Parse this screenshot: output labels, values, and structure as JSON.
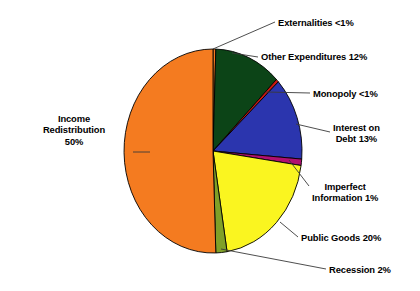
{
  "chart_data": {
    "type": "pie",
    "title": "",
    "subtitle": "",
    "xlabel": "",
    "ylabel": "",
    "legend_position": "none",
    "grid": false,
    "start_angle_deg": 0,
    "direction": "clockwise",
    "background_color": "#FFFFFF",
    "outline_color": "#000000",
    "categories": [
      "Externalities",
      "Other Expenditures",
      "Monopoly",
      "Interest on Debt",
      "Imperfect Information",
      "Public Goods",
      "Recession",
      "Income Redistribution"
    ],
    "values": [
      0.5,
      12,
      0.5,
      13,
      1,
      20,
      2,
      50
    ],
    "value_labels": [
      "<1%",
      "12%",
      "<1%",
      "13%",
      "1%",
      "20%",
      "2%",
      "50%"
    ],
    "colors": [
      "#F47B20",
      "#0C4417",
      "#CC1810",
      "#2B35AE",
      "#B01070",
      "#FAF520",
      "#80A028",
      "#F47B20"
    ],
    "slices": [
      {
        "name": "Externalities",
        "value": 0.5,
        "value_label": "<1%",
        "color": "#F47B20",
        "label_text": "Externalities <1%"
      },
      {
        "name": "Other Expenditures",
        "value": 12,
        "value_label": "12%",
        "color": "#0C4417",
        "label_text": "Other Expenditures 12%"
      },
      {
        "name": "Monopoly",
        "value": 0.5,
        "value_label": "<1%",
        "color": "#CC1810",
        "label_text": "Monopoly <1%"
      },
      {
        "name": "Interest on Debt",
        "value": 13,
        "value_label": "13%",
        "color": "#2B35AE",
        "label_text": "Interest on\nDebt 13%"
      },
      {
        "name": "Imperfect Information",
        "value": 1,
        "value_label": "1%",
        "color": "#B01070",
        "label_text": "Imperfect\nInformation 1%"
      },
      {
        "name": "Public Goods",
        "value": 20,
        "value_label": "20%",
        "color": "#FAF520",
        "label_text": "Public Goods 20%"
      },
      {
        "name": "Recession",
        "value": 2,
        "value_label": "2%",
        "color": "#80A028",
        "label_text": "Recession 2%"
      },
      {
        "name": "Income Redistribution",
        "value": 50,
        "value_label": "50%",
        "color": "#F47B20",
        "label_text": "Income\nRedistribution\n50%"
      }
    ]
  },
  "labels": {
    "externalities": "Externalities <1%",
    "other_expenditures": "Other Expenditures 12%",
    "monopoly": "Monopoly <1%",
    "interest_on_debt": "Interest on\nDebt 13%",
    "imperfect_information": "Imperfect\nInformation 1%",
    "public_goods": "Public Goods 20%",
    "recession": "Recession 2%",
    "income_redistribution": "Income\nRedistribution\n50%"
  }
}
